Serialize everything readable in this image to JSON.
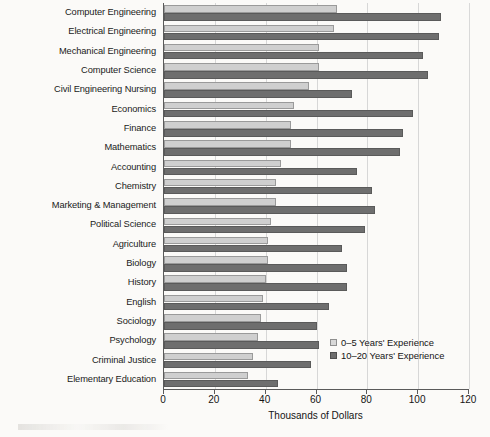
{
  "chart_data": {
    "type": "bar",
    "orientation": "horizontal",
    "title": "",
    "xlabel": "Thousands of Dollars",
    "ylabel": "",
    "xlim": [
      0,
      120
    ],
    "xticks": [
      0,
      20,
      40,
      60,
      80,
      100,
      120
    ],
    "grid": true,
    "legend_position": "inside-bottom-right",
    "categories": [
      "Computer Engineering",
      "Electrical Engineering",
      "Mechanical Engineering",
      "Computer Science",
      "Civil Engineering Nursing",
      "Economics",
      "Finance",
      "Mathematics",
      "Accounting",
      "Chemistry",
      "Marketing & Management",
      "Political Science",
      "Agriculture",
      "Biology",
      "History",
      "English",
      "Sociology",
      "Psychology",
      "Criminal Justice",
      "Elementary Education"
    ],
    "series": [
      {
        "name": "0–5 Years' Experience",
        "color": "#cfcfcf",
        "values": [
          68,
          67,
          61,
          61,
          57,
          51,
          50,
          50,
          46,
          44,
          44,
          42,
          41,
          41,
          40,
          39,
          38,
          37,
          35,
          33
        ]
      },
      {
        "name": "10–20 Years' Experience",
        "color": "#6e6e6e",
        "values": [
          109,
          108,
          102,
          104,
          74,
          98,
          94,
          93,
          76,
          82,
          83,
          79,
          70,
          72,
          72,
          65,
          60,
          61,
          58,
          45
        ]
      }
    ]
  },
  "legend": {
    "items": [
      {
        "label": "0–5 Years' Experience",
        "swatch": "light"
      },
      {
        "label": "10–20 Years' Experience",
        "swatch": "dark"
      }
    ]
  },
  "colors": {
    "background": "#fbfaf8",
    "axis": "#5a5a5a",
    "grid": "#d7d7d7",
    "series_light": "#cfcfcf",
    "series_dark": "#6e6e6e",
    "text": "#141414"
  }
}
